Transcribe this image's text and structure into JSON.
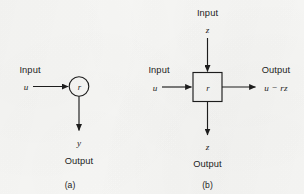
{
  "figure": {
    "background_color": "#f8f8f6",
    "ink_color": "#1d1d1d",
    "panels": [
      {
        "id": "a",
        "caption": "(a)",
        "node": {
          "shape": "circle",
          "label": "r"
        },
        "ports": [
          {
            "id": "input-u",
            "role_label": "Input",
            "signal_label": "u",
            "direction": "in",
            "side": "left"
          },
          {
            "id": "output-y",
            "role_label": "Output",
            "signal_label": "y",
            "direction": "out",
            "side": "bottom"
          }
        ]
      },
      {
        "id": "b",
        "caption": "(b)",
        "node": {
          "shape": "square",
          "label": "r"
        },
        "ports": [
          {
            "id": "input-z-top",
            "role_label": "Input",
            "signal_label": "z",
            "direction": "in",
            "side": "top"
          },
          {
            "id": "input-u-left",
            "role_label": "Input",
            "signal_label": "u",
            "direction": "in",
            "side": "left"
          },
          {
            "id": "output-u-minus-rz",
            "role_label": "Output",
            "signal_label": "u − rz",
            "direction": "out",
            "side": "right"
          },
          {
            "id": "output-z-bottom",
            "role_label": "Output",
            "signal_label": "z",
            "direction": "out",
            "side": "bottom"
          }
        ]
      }
    ]
  }
}
